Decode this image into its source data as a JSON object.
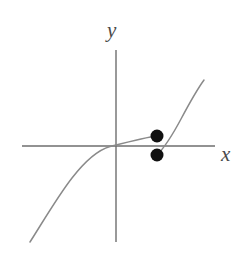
{
  "figure": {
    "name": "piecewise-function-graph",
    "background_color": "#ffffff",
    "axis_color": "#6e6e6e",
    "curve_color": "#8a8a8a",
    "point_color": "#111111"
  },
  "labels": {
    "y_axis": "y",
    "x_axis": "x"
  },
  "chart_data": {
    "type": "line",
    "title": "",
    "xlabel": "x",
    "ylabel": "y",
    "grid": false,
    "legend": null,
    "xlim": [
      -3.2,
      2.2
    ],
    "ylim": [
      -2.2,
      2.2
    ],
    "origin_px": [
      116,
      146
    ],
    "axes": {
      "x_axis_px": {
        "x1": 22,
        "y1": 146,
        "x2": 215,
        "y2": 146
      },
      "y_axis_px": {
        "x1": 116,
        "y1": 50,
        "x2": 116,
        "y2": 242
      }
    },
    "series": [
      {
        "name": "left-branch",
        "description": "cube-root shaped curve rising from lower-left through the origin, flattening to a closed endpoint above the x-axis",
        "style": "solid",
        "path_px": "M 30 242 C 44 220 58 196 72 178 C 86 160 98 150 110 146.5 C 122 143.5 132 141 141 139 C 148 137.4 153 136.4 157 136"
      },
      {
        "name": "right-branch",
        "description": "steeply rising curve starting at a closed endpoint below the x-axis and increasing to the upper right",
        "style": "solid",
        "path_px": "M 157 155 C 165 147 173 134 181 119 C 189 104 196 91 204 80"
      }
    ],
    "points": [
      {
        "name": "upper-endpoint",
        "filled": true,
        "px": [
          157,
          136
        ],
        "radius_px": 6.5
      },
      {
        "name": "lower-endpoint",
        "filled": true,
        "px": [
          157,
          155
        ],
        "radius_px": 6.5
      }
    ],
    "annotations": []
  }
}
